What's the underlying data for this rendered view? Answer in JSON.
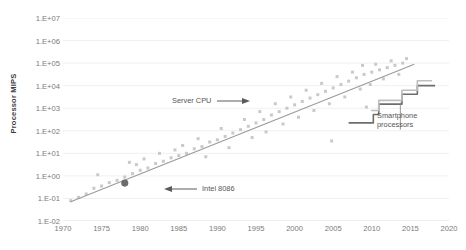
{
  "chart_data": {
    "type": "scatter",
    "title": "",
    "xlabel": "",
    "ylabel": "Processor MIPS",
    "xlim": [
      1970,
      2020
    ],
    "ylim": [
      -2,
      7
    ],
    "grid": true,
    "legend_position": "none",
    "y_tick_labels": [
      "1.E+07",
      "1.E+06",
      "1.E+05",
      "1.E+04",
      "1.E+03",
      "1.E+02",
      "1.E+01",
      "1.E+00",
      "1.E-01",
      "1.E-02"
    ],
    "y_tick_values": [
      7,
      6,
      5,
      4,
      3,
      2,
      1,
      0,
      -1,
      -2
    ],
    "x_tick_labels": [
      "1970",
      "1975",
      "1980",
      "1985",
      "1990",
      "1995",
      "2000",
      "2005",
      "2010",
      "2015",
      "2020"
    ],
    "x_tick_values": [
      1970,
      1975,
      1980,
      1985,
      1990,
      1995,
      2000,
      2005,
      2010,
      2015,
      2020
    ],
    "series": [
      {
        "name": "Server CPU scatter",
        "type": "scatter",
        "marker": "square",
        "color": "#c9c9c9",
        "points": [
          [
            1971,
            -1.1
          ],
          [
            1972,
            -0.95
          ],
          [
            1973,
            -0.8
          ],
          [
            1974,
            -0.55
          ],
          [
            1974.5,
            0.05
          ],
          [
            1975,
            -0.45
          ],
          [
            1976,
            -0.3
          ],
          [
            1977,
            -0.2
          ],
          [
            1978,
            -0.05
          ],
          [
            1978.6,
            0.6
          ],
          [
            1979,
            0.1
          ],
          [
            1979.5,
            0.5
          ],
          [
            1980,
            0.25
          ],
          [
            1980.5,
            0.75
          ],
          [
            1981,
            0.35
          ],
          [
            1982,
            0.55
          ],
          [
            1982.5,
            1.0
          ],
          [
            1983,
            0.65
          ],
          [
            1984,
            0.8
          ],
          [
            1984.5,
            1.15
          ],
          [
            1985,
            0.9
          ],
          [
            1985.5,
            1.35
          ],
          [
            1986,
            1.0
          ],
          [
            1987,
            1.2
          ],
          [
            1987.5,
            1.65
          ],
          [
            1988,
            1.3
          ],
          [
            1988.5,
            0.85
          ],
          [
            1989,
            1.5
          ],
          [
            1990,
            1.6
          ],
          [
            1990.5,
            2.1
          ],
          [
            1991,
            1.75
          ],
          [
            1991.5,
            1.25
          ],
          [
            1992,
            1.9
          ],
          [
            1993,
            2.05
          ],
          [
            1993.5,
            2.5
          ],
          [
            1994,
            2.2
          ],
          [
            1994.5,
            1.7
          ],
          [
            1995,
            2.35
          ],
          [
            1995.5,
            2.85
          ],
          [
            1996,
            2.5
          ],
          [
            1996.3,
            1.95
          ],
          [
            1997,
            2.7
          ],
          [
            1997.5,
            3.2
          ],
          [
            1998,
            2.85
          ],
          [
            1998.5,
            2.3
          ],
          [
            1999,
            3.0
          ],
          [
            1999.5,
            3.5
          ],
          [
            2000,
            3.15
          ],
          [
            2000.5,
            2.6
          ],
          [
            2001,
            3.3
          ],
          [
            2001.5,
            3.8
          ],
          [
            2002,
            3.45
          ],
          [
            2002.5,
            2.9
          ],
          [
            2003,
            3.6
          ],
          [
            2003.5,
            4.1
          ],
          [
            2004,
            3.75
          ],
          [
            2004.5,
            3.2
          ],
          [
            2004.8,
            1.55
          ],
          [
            2005,
            3.9
          ],
          [
            2005.5,
            4.4
          ],
          [
            2006,
            4.05
          ],
          [
            2006.5,
            3.5
          ],
          [
            2007,
            4.2
          ],
          [
            2007.5,
            4.6
          ],
          [
            2008,
            4.35
          ],
          [
            2008.5,
            3.85
          ],
          [
            2008.8,
            4.9
          ],
          [
            2009,
            4.5
          ],
          [
            2009.3,
            3.05
          ],
          [
            2009.8,
            4.05
          ],
          [
            2010,
            4.6
          ],
          [
            2010.5,
            4.95
          ],
          [
            2011,
            4.7
          ],
          [
            2011.5,
            4.3
          ],
          [
            2012,
            4.8
          ],
          [
            2012.5,
            5.1
          ],
          [
            2013,
            4.9
          ],
          [
            2013.5,
            4.5
          ],
          [
            2014,
            5.0
          ],
          [
            2014.5,
            5.2
          ]
        ]
      },
      {
        "name": "Server CPU trend",
        "type": "line",
        "color": "#9a9a9a",
        "points": [
          [
            1971,
            -1.15
          ],
          [
            2015.5,
            4.95
          ]
        ]
      },
      {
        "name": "Smartphone processors (dark)",
        "type": "step",
        "color": "#6d6d6d",
        "points": [
          [
            2007,
            2.35
          ],
          [
            2009.6,
            2.35
          ],
          [
            2010.2,
            2.72
          ],
          [
            2010.6,
            2.72
          ],
          [
            2010.9,
            3.18
          ],
          [
            2013.4,
            3.18
          ],
          [
            2013.9,
            3.62
          ],
          [
            2015.4,
            3.62
          ],
          [
            2015.9,
            4.0
          ],
          [
            2018.2,
            4.0
          ]
        ]
      },
      {
        "name": "Smartphone processors (light)",
        "type": "step",
        "color": "#bdbdbd",
        "points": [
          [
            2009.9,
            2.9
          ],
          [
            2010.5,
            2.9
          ],
          [
            2010.9,
            3.35
          ],
          [
            2013.4,
            3.35
          ],
          [
            2013.9,
            3.8
          ],
          [
            2015.4,
            3.8
          ],
          [
            2015.9,
            4.22
          ],
          [
            2017.8,
            4.22
          ]
        ]
      },
      {
        "name": "Intel 8086",
        "type": "scatter",
        "marker": "circle",
        "color": "#6b6b6b",
        "points": [
          [
            1978,
            -0.32
          ]
        ]
      }
    ],
    "annotations": [
      {
        "name": "server-cpu",
        "text": "Server CPU",
        "arrow": "right"
      },
      {
        "name": "intel-8086",
        "text": "Intel 8086",
        "arrow": "left"
      },
      {
        "name": "smartphone",
        "text": "Smartphone processors",
        "arrow": "leader-up"
      }
    ]
  },
  "annotations": {
    "server_cpu": "Server CPU",
    "intel_8086": "Intel 8086",
    "smartphone_line1": "Smartphone",
    "smartphone_line2": "processors"
  },
  "axis": {
    "y_title": "Processor MIPS"
  }
}
